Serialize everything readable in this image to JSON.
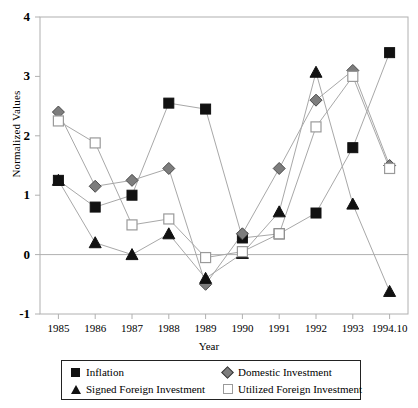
{
  "chart_data": {
    "type": "line",
    "title": "",
    "xlabel": "Year",
    "ylabel": "Normalized Values",
    "categories": [
      "1985",
      "1986",
      "1987",
      "1988",
      "1989",
      "1990",
      "1991",
      "1992",
      "1993",
      "1994.10"
    ],
    "ylim": [
      -1,
      4
    ],
    "yticks": [
      -1,
      0,
      1,
      2,
      3,
      4
    ],
    "ytick_labels": [
      "-1",
      "0",
      "1",
      "2",
      "3",
      "4"
    ],
    "grid": false,
    "zero_line": true,
    "legend_position": "bottom",
    "series": [
      {
        "name": "Inflation",
        "marker": "filled-square",
        "color": "#111111",
        "values": [
          1.25,
          0.8,
          1.0,
          2.55,
          2.45,
          0.28,
          0.35,
          0.7,
          1.8,
          3.4
        ]
      },
      {
        "name": "Domestic Investment",
        "marker": "filled-diamond",
        "color": "#7d7d7d",
        "values": [
          2.4,
          1.15,
          1.25,
          1.45,
          -0.5,
          0.35,
          1.45,
          2.6,
          3.1,
          1.5
        ]
      },
      {
        "name": "Signed Foreign Investment",
        "marker": "filled-triangle",
        "color": "#111111",
        "values": [
          1.25,
          0.2,
          0.0,
          0.35,
          -0.4,
          0.02,
          0.72,
          3.07,
          0.85,
          -0.62
        ]
      },
      {
        "name": "Utilized Foreign Investment",
        "marker": "open-square",
        "color": "#9a9a9a",
        "values": [
          2.25,
          1.88,
          0.5,
          0.6,
          -0.05,
          0.05,
          0.35,
          2.15,
          3.0,
          1.45
        ]
      }
    ]
  },
  "legend": {
    "entries": [
      {
        "label": "Inflation",
        "marker": "filled-square"
      },
      {
        "label": "Domestic Investment",
        "marker": "filled-diamond"
      },
      {
        "label": "Signed Foreign Investment",
        "marker": "filled-triangle"
      },
      {
        "label": "Utilized Foreign Investment",
        "marker": "open-square"
      }
    ]
  },
  "colors": {
    "axis": "#b0b0b0",
    "line": "#a8a8a8",
    "text": "#000000",
    "legend_border": "#222222"
  }
}
